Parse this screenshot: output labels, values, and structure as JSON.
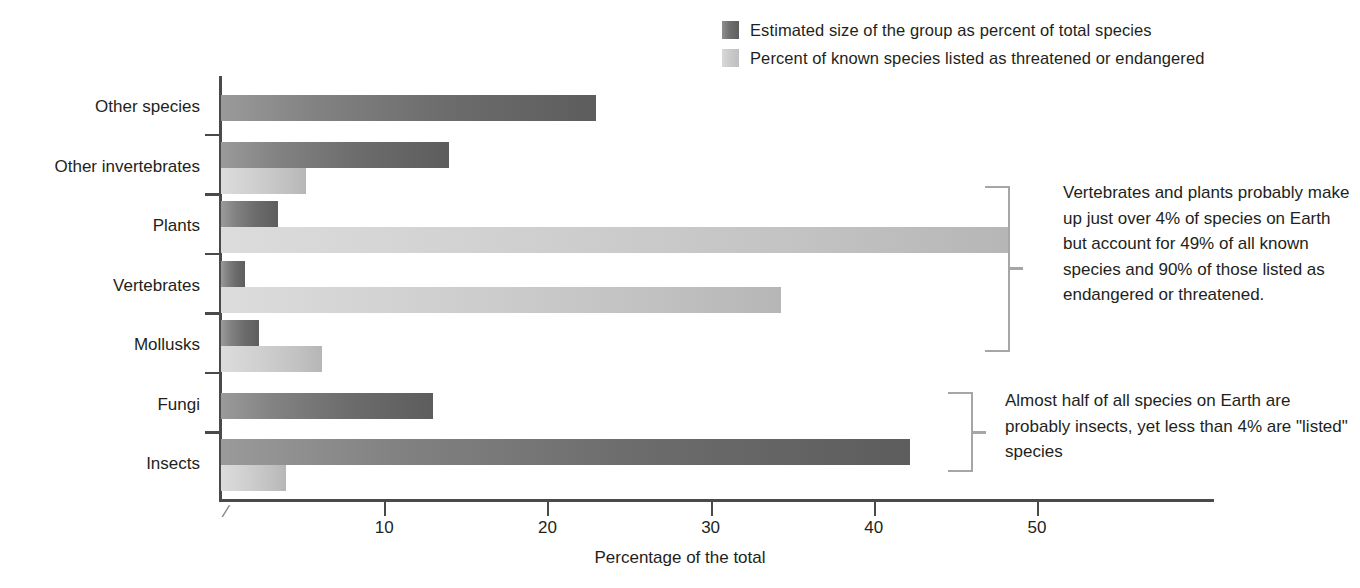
{
  "chart_data": {
    "type": "bar",
    "orientation": "horizontal",
    "title": "",
    "xlabel": "Percentage of the total",
    "ylabel": "",
    "xlim": [
      0,
      55
    ],
    "xticks": [
      10,
      20,
      30,
      40,
      50
    ],
    "grid": false,
    "axis_break": true,
    "legend_position": "top-right",
    "categories": [
      "Other species",
      "Other invertebrates",
      "Plants",
      "Vertebrates",
      "Mollusks",
      "Fungi",
      "Insects"
    ],
    "series": [
      {
        "name": "Estimated size of the group as percent of total species",
        "color": "#6c6c6c",
        "values": [
          23,
          14,
          3.5,
          1.5,
          2.3,
          13,
          42.2
        ]
      },
      {
        "name": "Percent of known species listed as threatened or endangered",
        "color": "#c6c6c6",
        "values": [
          0,
          5.2,
          48.3,
          34.3,
          6.2,
          0,
          4.0
        ]
      }
    ],
    "annotations": [
      {
        "id": "annotation-1",
        "text": "Vertebrates and plants probably make up just over 4% of species on Earth but account for 49% of all known species and 90% of those listed as endangered or threatened.",
        "targets": [
          "Plants",
          "Vertebrates"
        ]
      },
      {
        "id": "annotation-2",
        "text": "Almost half of all species on Earth are probably insects, yet less than 4% are \"listed\" species",
        "targets": [
          "Insects"
        ]
      }
    ]
  },
  "legend": {
    "items": [
      {
        "label": "Estimated size of the group as percent of total species",
        "swatch": "dark"
      },
      {
        "label": "Percent of known species listed as threatened or endangered",
        "swatch": "light"
      }
    ]
  },
  "axis": {
    "x_title": "Percentage of the total",
    "break_symbol": "∕",
    "tick_labels": [
      "10",
      "20",
      "30",
      "40",
      "50"
    ]
  }
}
